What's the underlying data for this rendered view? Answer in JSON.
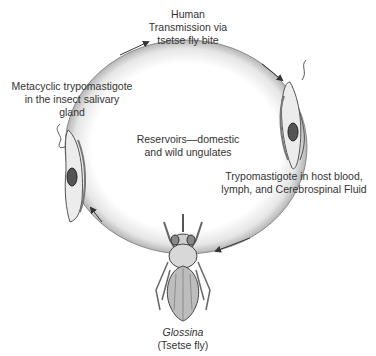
{
  "labels": {
    "top": [
      "Human",
      "Transmission via",
      "tsetse fly bite"
    ],
    "left": [
      "Metacyclic trypomastigote",
      "in the insect salivary",
      "gland"
    ],
    "center": [
      "Reservoirs—domestic",
      "and wild ungulates"
    ],
    "right": [
      "Trypomastigote in host blood,",
      "lymph, and Cerebrospinal Fluid"
    ],
    "bottom_genus": "Glossina",
    "bottom_common": "(Tsetse fly)"
  },
  "colors": {
    "ring_outer": "#9a9a9a",
    "ring_inner": "#ffffff",
    "arrow": "#333333"
  }
}
